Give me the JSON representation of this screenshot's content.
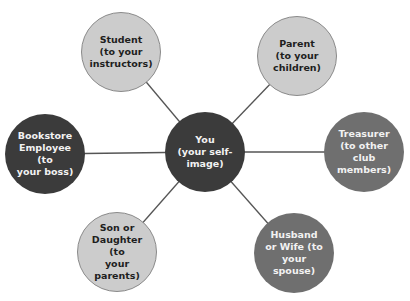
{
  "diagram": {
    "center": {
      "id": "you",
      "label": "You\n(your self-\nimage)",
      "x": 205,
      "y": 152,
      "tone": "dark"
    },
    "nodes": [
      {
        "id": "student",
        "label": "Student\n(to your\ninstructors)",
        "x": 121,
        "y": 52,
        "tone": "light"
      },
      {
        "id": "parent",
        "label": "Parent\n(to your\nchildren)",
        "x": 297,
        "y": 56,
        "tone": "light"
      },
      {
        "id": "bookstore",
        "label": "Bookstore\nEmployee (to\nyour boss)",
        "x": 45,
        "y": 154,
        "tone": "dark"
      },
      {
        "id": "treasurer",
        "label": "Treasurer\n(to other club\nmembers)",
        "x": 364,
        "y": 152,
        "tone": "medium"
      },
      {
        "id": "son-daughter",
        "label": "Son or\nDaughter (to\nyour parents)",
        "x": 117,
        "y": 252,
        "tone": "light"
      },
      {
        "id": "husband-wife",
        "label": "Husband\nor Wife (to\nyour spouse)",
        "x": 294,
        "y": 253,
        "tone": "medium"
      }
    ],
    "edges": [
      [
        "you",
        "student"
      ],
      [
        "you",
        "parent"
      ],
      [
        "you",
        "bookstore"
      ],
      [
        "you",
        "treasurer"
      ],
      [
        "you",
        "son-daughter"
      ],
      [
        "you",
        "husband-wife"
      ]
    ],
    "colors": {
      "light": "#cccccc",
      "dark": "#3b3b3b",
      "medium": "#6f6f6f",
      "line": "#555555"
    }
  }
}
